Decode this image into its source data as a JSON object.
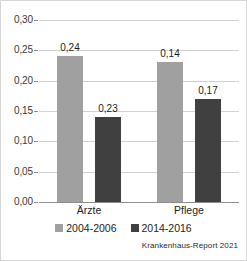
{
  "chart_data": {
    "type": "bar",
    "title": "",
    "xlabel": "",
    "ylabel": "",
    "categories": [
      "Ärzte",
      "Pflege"
    ],
    "series": [
      {
        "name": "2004-2006",
        "values": [
          0.24,
          0.23
        ],
        "color": "#a0a0a0"
      },
      {
        "name": "2014-2016",
        "values": [
          0.14,
          0.17
        ],
        "color": "#404040"
      }
    ],
    "value_labels": [
      [
        "0,24",
        "0,14"
      ],
      [
        "0,23",
        "0,17"
      ]
    ],
    "ylim": [
      0,
      0.3
    ],
    "ytick_values": [
      0.0,
      0.05,
      0.1,
      0.15,
      0.2,
      0.25,
      0.3
    ],
    "ytick_labels": [
      "0,00",
      "0,05",
      "0,10",
      "0,15",
      "0,20",
      "0,25",
      "0,30"
    ],
    "grid": "horizontal",
    "legend_position": "bottom-center",
    "decimal_separator": ","
  },
  "source": {
    "note": "Krankenhaus-Report 2021"
  },
  "colors": {
    "series_2004_2006": "#a0a0a0",
    "series_2014_2016": "#404040",
    "gridline": "#d2d2d2",
    "axis": "#8d8d8d",
    "border": "#d7d7d7"
  }
}
